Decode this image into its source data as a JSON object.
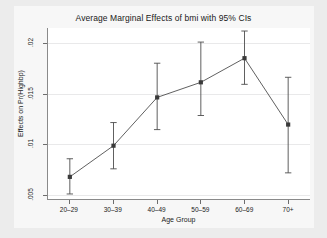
{
  "chart_data": {
    "type": "line",
    "title": "Average Marginal Effects of bmi with 95% CIs",
    "xlabel": "Age Group",
    "ylabel": "Effects on Pr(Highbp)",
    "categories": [
      "20–29",
      "30–39",
      "40–49",
      "50–59",
      "60–69",
      "70+"
    ],
    "values": [
      0.0067,
      0.0098,
      0.0146,
      0.0161,
      0.0185,
      0.0119
    ],
    "ci_lower": [
      0.005,
      0.0075,
      0.0114,
      0.0128,
      0.0159,
      0.0071
    ],
    "ci_upper": [
      0.0085,
      0.0121,
      0.018,
      0.0201,
      0.0212,
      0.0166
    ],
    "ytick_labels": [
      ".02",
      ".015",
      ".01",
      ".005"
    ],
    "ytick_values": [
      0.02,
      0.015,
      0.01,
      0.005
    ],
    "ylim": [
      0.0045,
      0.0215
    ],
    "grid": true,
    "legend": "none",
    "marker": "square",
    "series_color": "#4d4d4d",
    "grid_color": "#e9e9ea",
    "plot_background": "#ffffff",
    "figure_background": "#f7f7f7",
    "outer_background": "#ececec"
  }
}
